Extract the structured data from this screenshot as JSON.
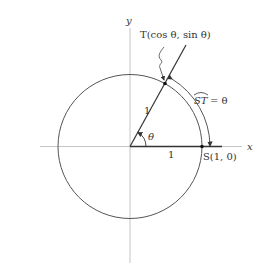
{
  "figure": {
    "type": "unit-circle-diagram",
    "axes": {
      "x_label": "x",
      "y_label": "y"
    },
    "labels": {
      "point_T": "T(cos θ, sin θ)",
      "point_S": "S(1, 0)",
      "radius_label": "1",
      "x_segment_label": "1",
      "angle_label": "θ",
      "arc_label_lhs": "ST",
      "arc_label_rhs": "= θ"
    },
    "geometry": {
      "center": [
        130,
        146.5
      ],
      "radius": 72,
      "theta_deg": 61
    },
    "colors": {
      "axis": "#bbbbbb",
      "stroke": "#444444",
      "text": "#333333"
    }
  }
}
